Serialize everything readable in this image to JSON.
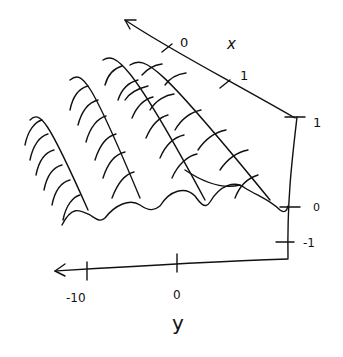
{
  "diagram": {
    "type": "hand-drawn 3D surface sketch",
    "ink_color": "#111111",
    "background": "#ffffff",
    "x_axis": {
      "label": "x",
      "ticks": [
        {
          "label": "0"
        },
        {
          "label": "1"
        }
      ]
    },
    "y_axis": {
      "label": "y",
      "ticks": [
        {
          "label": "-10"
        },
        {
          "label": "0"
        }
      ]
    },
    "z_axis": {
      "ticks": [
        {
          "label": "1"
        },
        {
          "label": "0"
        },
        {
          "label": "-1"
        }
      ]
    },
    "surface": {
      "description": "oscillating wave surface with ~5 ridges",
      "ridges": 5
    }
  }
}
